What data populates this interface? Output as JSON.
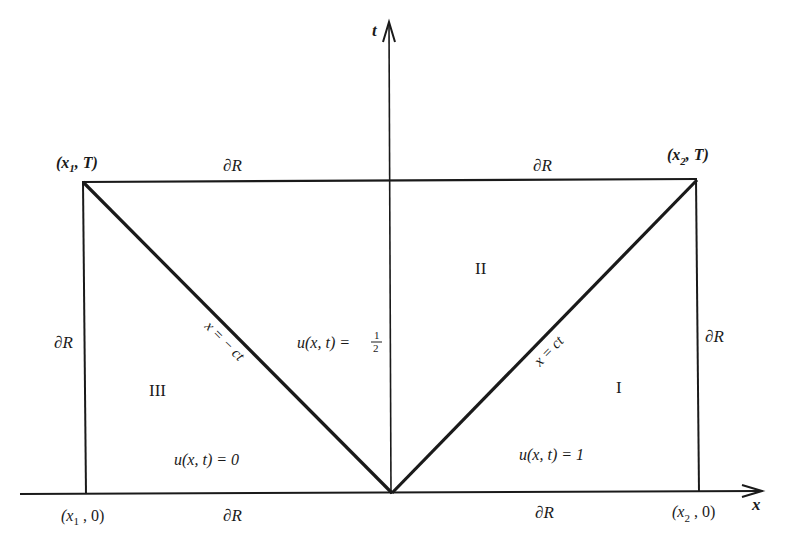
{
  "diagram": {
    "axes": {
      "t_label": "t",
      "x_label": "x"
    },
    "corners": {
      "top_left": {
        "pre": "(x",
        "sub": "1",
        "post": ", T)"
      },
      "top_right": {
        "pre": "(x",
        "sub": "2",
        "post": ", T)"
      },
      "bottom_left": {
        "pre": "(x",
        "sub": "1",
        "post": " , 0)"
      },
      "bottom_right": {
        "pre": "(x",
        "sub": "2",
        "post": " , 0)"
      }
    },
    "boundary_label": "∂R",
    "regions": {
      "I": "I",
      "II": "II",
      "III": "III"
    },
    "values": {
      "region_I": "u(x, t) = 1",
      "region_II_prefix": "u(x, t) = ",
      "region_II_num": "1",
      "region_II_den": "2",
      "region_III": "u(x, t) = 0"
    },
    "characteristics": {
      "left": "x = − ct",
      "right": "x = ct"
    },
    "colors": {
      "ink": "#1a1a1a",
      "background": "#ffffff"
    }
  }
}
